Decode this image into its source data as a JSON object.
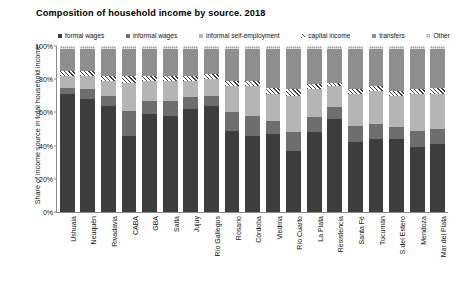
{
  "chart_data": {
    "type": "bar",
    "subtype": "stacked-percentage",
    "title": "Composition of household income by source. 2018",
    "xlabel": "",
    "ylabel": "Share of income source in total household income",
    "ylim": [
      0,
      100
    ],
    "ytick_labels": [
      "0%",
      "20%",
      "40%",
      "60%",
      "80%",
      "100%"
    ],
    "ytick_values": [
      0,
      20,
      40,
      60,
      80,
      100
    ],
    "grid": false,
    "legend_position": "top",
    "categories": [
      "Ushuaia",
      "Neuquén",
      "Rivadavia",
      "CABA",
      "GBA",
      "Salta",
      "Jujuy",
      "Río Gallegos",
      "Rosario",
      "Córdoba",
      "Viedma",
      "Río Cuarto",
      "La Plata",
      "Resistencia",
      "Santa Fé",
      "Tucumán",
      "S.del Estero",
      "Mendoza",
      "Mar del Plata"
    ],
    "series": [
      {
        "name": "formal wages",
        "color": "#3d3d3d",
        "pattern": "solid",
        "values": [
          71,
          68,
          64,
          46,
          59,
          58,
          62,
          64,
          49,
          46,
          47,
          37,
          48,
          56,
          42,
          44,
          44,
          39,
          41
        ]
      },
      {
        "name": "informal wages",
        "color": "#6e6e6e",
        "pattern": "solid",
        "values": [
          4,
          6,
          6,
          15,
          8,
          9,
          7,
          6,
          11,
          12,
          8,
          11,
          9,
          7,
          10,
          9,
          7,
          10,
          9
        ]
      },
      {
        "name": "informal self-employment",
        "color": "#b5b5b5",
        "pattern": "solid",
        "values": [
          7,
          8,
          9,
          17,
          12,
          12,
          10,
          10,
          16,
          18,
          16,
          22,
          17,
          13,
          19,
          20,
          19,
          22,
          21
        ]
      },
      {
        "name": "capital income",
        "color": "#f2f2f2",
        "pattern": "diagonal-hatch",
        "values": [
          3,
          3,
          3,
          4,
          3,
          3,
          3,
          3,
          3,
          3,
          4,
          4,
          3,
          2,
          3,
          3,
          3,
          3,
          4
        ]
      },
      {
        "name": "transfers",
        "color": "#8f8f8f",
        "pattern": "solid",
        "values": [
          13,
          13,
          16,
          16,
          16,
          16,
          16,
          15,
          19,
          19,
          23,
          24,
          21,
          20,
          24,
          22,
          25,
          24,
          23
        ]
      },
      {
        "name": "Other",
        "color": "#9a9a9a",
        "pattern": "checker",
        "values": [
          2,
          2,
          2,
          2,
          2,
          2,
          2,
          2,
          2,
          2,
          2,
          2,
          2,
          2,
          2,
          2,
          2,
          2,
          2
        ]
      }
    ]
  }
}
